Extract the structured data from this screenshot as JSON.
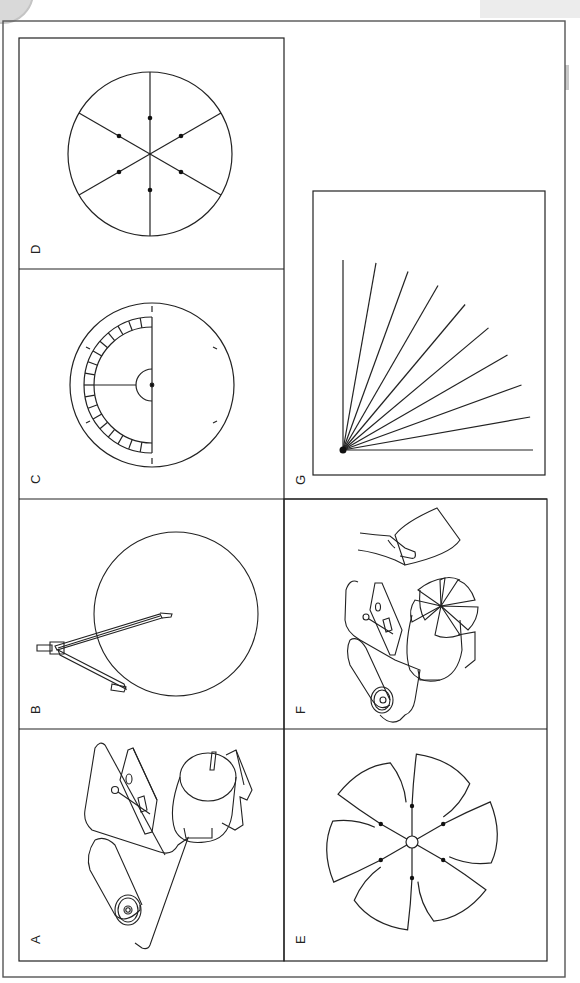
{
  "figure": {
    "panels": [
      {
        "id": "A",
        "label": "A",
        "content": "Motor with switch board, battery roller and wire loop"
      },
      {
        "id": "B",
        "label": "B",
        "content": "Compass drawing a circle"
      },
      {
        "id": "C",
        "label": "C",
        "content": "Protractor placed on circle with 60° tick marks"
      },
      {
        "id": "D",
        "label": "D",
        "content": "Circle divided into 6 equal sectors with dots"
      },
      {
        "id": "E",
        "label": "E",
        "content": "Six-blade cut-out fan with center hole"
      },
      {
        "id": "F",
        "label": "F",
        "content": "Fan mounted on motor, hand holding card"
      },
      {
        "id": "G",
        "label": "G",
        "content": "Fan of 10 lines spanning 90° from a corner point"
      }
    ],
    "colors": {
      "line": "#222222",
      "background": "#ffffff",
      "frame": "#555555"
    }
  }
}
